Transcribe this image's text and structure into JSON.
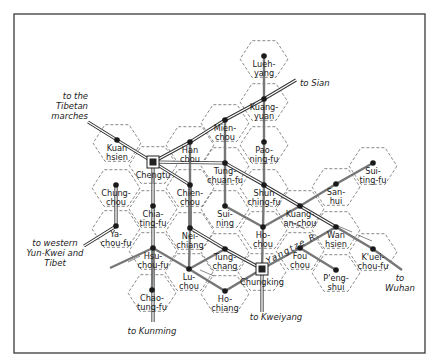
{
  "map": {
    "frame": {
      "x": 14,
      "y": 14,
      "w": 411,
      "h": 339
    },
    "hex_radius": 24,
    "colors": {
      "ink": "#222222",
      "route_primary": "#333333",
      "route_secondary": "#777777",
      "hex_grid": "#555555",
      "background": "#ffffff"
    },
    "places": [
      {
        "id": "lueh-yang",
        "lines": [
          "Lueh-",
          "yang"
        ],
        "x": 264,
        "y": 56,
        "type": "town"
      },
      {
        "id": "kuang-yuan",
        "lines": [
          "Kuang-",
          "yuan"
        ],
        "x": 264,
        "y": 99,
        "type": "town"
      },
      {
        "id": "pao-ning-fu",
        "lines": [
          "Pao-",
          "ning-fu"
        ],
        "x": 264,
        "y": 142,
        "type": "town"
      },
      {
        "id": "mien-chou",
        "lines": [
          "Mien-",
          "chou"
        ],
        "x": 225,
        "y": 120,
        "type": "town"
      },
      {
        "id": "han-chou",
        "lines": [
          "Han",
          "chou"
        ],
        "x": 190,
        "y": 142,
        "type": "town"
      },
      {
        "id": "kuan-hsien",
        "lines": [
          "Kuan",
          "hsien"
        ],
        "x": 117,
        "y": 140,
        "type": "town"
      },
      {
        "id": "chengtu",
        "lines": [
          "Chengtu"
        ],
        "x": 153,
        "y": 162,
        "type": "city"
      },
      {
        "id": "tung-chuan-fu",
        "lines": [
          "Tung-",
          "chuan-fu"
        ],
        "x": 225,
        "y": 163,
        "type": "town"
      },
      {
        "id": "shun-ching-fu",
        "lines": [
          "Shun",
          "ching-fu"
        ],
        "x": 264,
        "y": 185,
        "type": "town"
      },
      {
        "id": "chung-chou",
        "lines": [
          "Chung-",
          "chou"
        ],
        "x": 116,
        "y": 185,
        "type": "town"
      },
      {
        "id": "chien-chou",
        "lines": [
          "Chien-",
          "chou"
        ],
        "x": 190,
        "y": 185,
        "type": "town"
      },
      {
        "id": "chia-ting-fu",
        "lines": [
          "Chia-",
          "ting-fu"
        ],
        "x": 153,
        "y": 206,
        "type": "town"
      },
      {
        "id": "sui-ning",
        "lines": [
          "Sui-",
          "ning"
        ],
        "x": 225,
        "y": 206,
        "type": "town"
      },
      {
        "id": "ho-chou",
        "lines": [
          "Ho-",
          "chou"
        ],
        "x": 263,
        "y": 227,
        "type": "town"
      },
      {
        "id": "kuang-an-chou",
        "lines": [
          "Kuang-",
          "an-chou"
        ],
        "x": 300,
        "y": 206,
        "type": "town"
      },
      {
        "id": "san-hui",
        "lines": [
          "San-",
          "hui"
        ],
        "x": 336,
        "y": 184,
        "type": "town"
      },
      {
        "id": "sui-ting-fu",
        "lines": [
          "Sui-",
          "ting-fu"
        ],
        "x": 373,
        "y": 163,
        "type": "town"
      },
      {
        "id": "wan-hsien",
        "lines": [
          "Wan",
          "hsien"
        ],
        "x": 336,
        "y": 227,
        "type": "town"
      },
      {
        "id": "ya-chou-fu",
        "lines": [
          "Ya-",
          "chou-fu"
        ],
        "x": 116,
        "y": 226,
        "type": "town"
      },
      {
        "id": "nei-chiang",
        "lines": [
          "Nei-",
          "chiang"
        ],
        "x": 190,
        "y": 228,
        "type": "town"
      },
      {
        "id": "hsu-chou-fu",
        "lines": [
          "Hsu-",
          "chou-fu"
        ],
        "x": 153,
        "y": 248,
        "type": "town"
      },
      {
        "id": "tung-chang",
        "lines": [
          "Tung-",
          "chang"
        ],
        "x": 225,
        "y": 249,
        "type": "town"
      },
      {
        "id": "lu-chou",
        "lines": [
          "Lu-",
          "chou"
        ],
        "x": 189,
        "y": 269,
        "type": "town"
      },
      {
        "id": "chungking",
        "lines": [
          "Chungking"
        ],
        "x": 262,
        "y": 269,
        "type": "city"
      },
      {
        "id": "fou-chou",
        "lines": [
          "Fou",
          "chou"
        ],
        "x": 300,
        "y": 248,
        "type": "town"
      },
      {
        "id": "kuei-chou-fu",
        "lines": [
          "K'uei-",
          "chou-fu"
        ],
        "x": 373,
        "y": 249,
        "type": "town"
      },
      {
        "id": "peng-shui",
        "lines": [
          "P'eng-",
          "shui"
        ],
        "x": 336,
        "y": 270,
        "type": "town"
      },
      {
        "id": "ho-chiang",
        "lines": [
          "Ho-",
          "chiang"
        ],
        "x": 225,
        "y": 291,
        "type": "town"
      },
      {
        "id": "chao-tung-fu",
        "lines": [
          "Chao-",
          "tung-fu"
        ],
        "x": 152,
        "y": 290,
        "type": "town"
      }
    ],
    "directions": [
      {
        "id": "to-tibetan-marches",
        "lines": [
          "to the",
          "Tibetan",
          "marches"
        ],
        "x": 88,
        "y": 99,
        "align": "end"
      },
      {
        "id": "to-sian",
        "lines": [
          "to Sian"
        ],
        "x": 300,
        "y": 86,
        "align": "start"
      },
      {
        "id": "to-western-yun-kwei",
        "lines": [
          "to western",
          "Yun-Kwei and",
          "Tibet"
        ],
        "x": 55,
        "y": 246,
        "align": "middle"
      },
      {
        "id": "to-kunming",
        "lines": [
          "to Kunming"
        ],
        "x": 152,
        "y": 334,
        "align": "middle"
      },
      {
        "id": "to-kweiyang",
        "lines": [
          "to Kweiyang"
        ],
        "x": 276,
        "y": 320,
        "align": "middle"
      },
      {
        "id": "to-wuhan",
        "lines": [
          "to",
          "Wuhan"
        ],
        "x": 400,
        "y": 281,
        "align": "middle"
      }
    ],
    "river_label": "Yangtze R."
  }
}
